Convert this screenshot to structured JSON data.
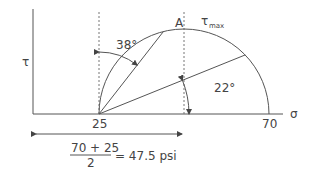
{
  "diagram": {
    "type": "mohr-circle",
    "axis_labels": {
      "y": "τ",
      "x": "σ"
    },
    "sigma_min": 25,
    "sigma_max": 70,
    "point_label": "A",
    "tau_max_label": "τ",
    "tau_max_sub": "max",
    "tick_labels": {
      "left": "25",
      "right": "70"
    },
    "angle_upper": {
      "value": 38,
      "label": "38°"
    },
    "angle_lower": {
      "value": 22,
      "label": "22°"
    },
    "formula": {
      "numerator": "70 + 25",
      "denominator": "2",
      "result": "= 47.5 psi"
    }
  }
}
